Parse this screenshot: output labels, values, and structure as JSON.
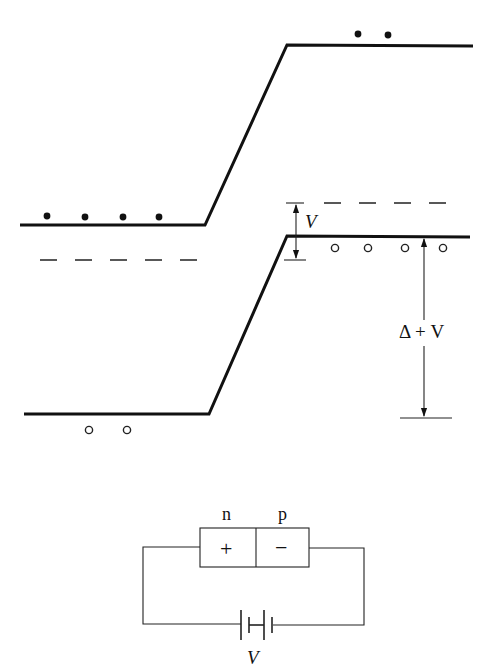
{
  "diagram": {
    "labels": {
      "bias_arrow": "V",
      "gap_arrow": "Δ + V",
      "n_region": "n",
      "p_region": "p",
      "n_sign": "+",
      "p_sign": "−",
      "battery_label": "V"
    },
    "bands": {
      "upper": {
        "left_y": 225,
        "right_y": 45
      },
      "lower": {
        "left_y": 414,
        "right_y": 236
      }
    },
    "fermi_levels": {
      "left_y": 260,
      "right_y": 203
    },
    "electrons": {
      "left_count": 4,
      "right_count": 2
    },
    "holes": {
      "left_count": 2,
      "right_count": 4
    },
    "colors": {
      "ink": "#111111",
      "background": "#ffffff"
    }
  }
}
